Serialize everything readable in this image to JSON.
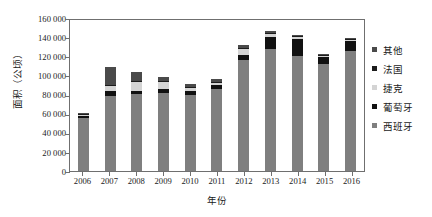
{
  "chart_data": {
    "type": "bar",
    "subtype": "stacked-column",
    "title": "",
    "xlabel": "年份",
    "ylabel": "面积（公顷）",
    "categories": [
      "2006",
      "2007",
      "2008",
      "2009",
      "2010",
      "2011",
      "2012",
      "2013",
      "2014",
      "2015",
      "2016"
    ],
    "ylim": [
      0,
      160000
    ],
    "ytick_step": 20000,
    "ytick_labels": [
      "160 000",
      "140 000",
      "120 000",
      "100 000",
      "80 000",
      "60 000",
      "40 000",
      "20 000",
      "0"
    ],
    "ytick_values": [
      160000,
      140000,
      120000,
      100000,
      80000,
      60000,
      40000,
      20000,
      0
    ],
    "grid": false,
    "legend_position": "right",
    "series": [
      {
        "name": "西班牙",
        "color": "#7f7f7f",
        "values": [
          55000,
          78000,
          81000,
          82000,
          80000,
          86000,
          116000,
          128000,
          120000,
          112000,
          126000
        ]
      },
      {
        "name": "葡萄牙",
        "color": "#111111",
        "values": [
          3000,
          6000,
          3000,
          4000,
          4000,
          4000,
          5000,
          12000,
          18000,
          7000,
          10000
        ]
      },
      {
        "name": "捷克",
        "color": "#d4d4d4",
        "values": [
          1000,
          5000,
          9000,
          7000,
          3000,
          2000,
          7000,
          3000,
          2000,
          1000,
          1000
        ]
      },
      {
        "name": "法国",
        "color": "#1c1c1c",
        "values": [
          1000,
          1000,
          1000,
          1000,
          1000,
          1000,
          1000,
          1000,
          1000,
          1000,
          1000
        ]
      },
      {
        "name": "其他",
        "color": "#4a4a4a",
        "values": [
          1000,
          19000,
          10000,
          4000,
          3000,
          3000,
          3000,
          2000,
          1000,
          1000,
          1000
        ]
      }
    ],
    "totals": [
      61000,
      109000,
      104000,
      98000,
      91000,
      96000,
      132000,
      146000,
      142000,
      122000,
      139000
    ]
  },
  "legend": {
    "items": [
      {
        "label": "其他",
        "color": "#4a4a4a"
      },
      {
        "label": "法国",
        "color": "#1c1c1c"
      },
      {
        "label": "捷克",
        "color": "#d4d4d4"
      },
      {
        "label": "葡萄牙",
        "color": "#111111"
      },
      {
        "label": "西班牙",
        "color": "#7f7f7f"
      }
    ]
  }
}
